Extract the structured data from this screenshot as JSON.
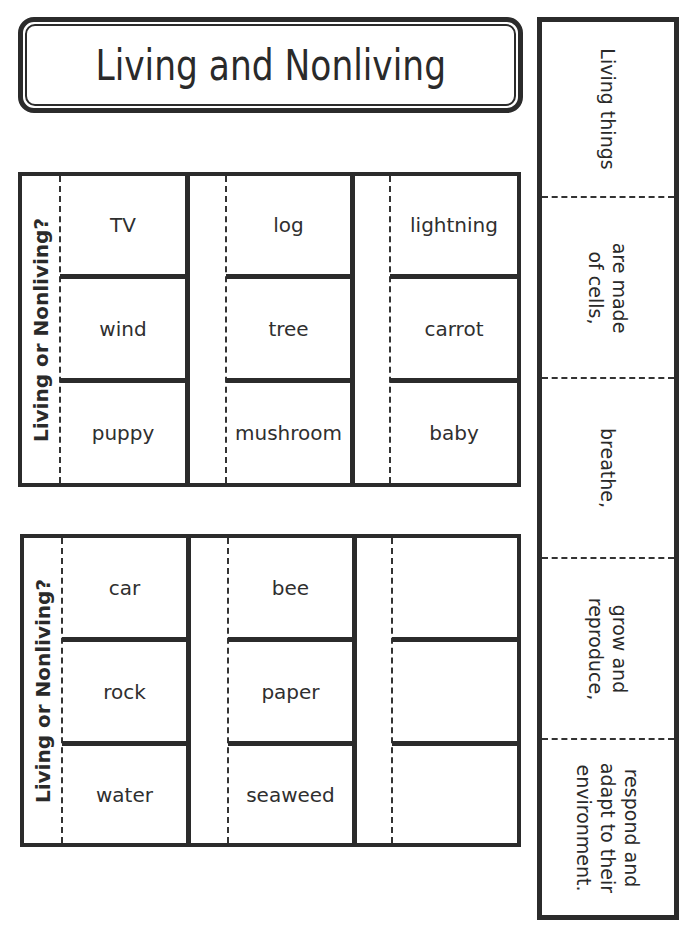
{
  "title": "Living and Nonliving",
  "grids": [
    {
      "side_label": "Living or Nonliving?",
      "columns": [
        [
          "TV",
          "wind",
          "puppy"
        ],
        [
          "log",
          "tree",
          "mushroom"
        ],
        [
          "lightning",
          "carrot",
          "baby"
        ]
      ]
    },
    {
      "side_label": "Living or Nonliving?",
      "columns": [
        [
          "car",
          "rock",
          "water"
        ],
        [
          "bee",
          "paper",
          "seaweed"
        ],
        [
          "",
          "",
          ""
        ]
      ]
    }
  ],
  "strip": {
    "segments": [
      "Living things",
      "are made\nof cells,",
      "breathe,",
      "grow and\nreproduce,",
      "respond and\nadapt to their\nenvironment."
    ]
  },
  "colors": {
    "line": "#2b2b2b",
    "text": "#2a2a2a",
    "background": "#ffffff"
  }
}
